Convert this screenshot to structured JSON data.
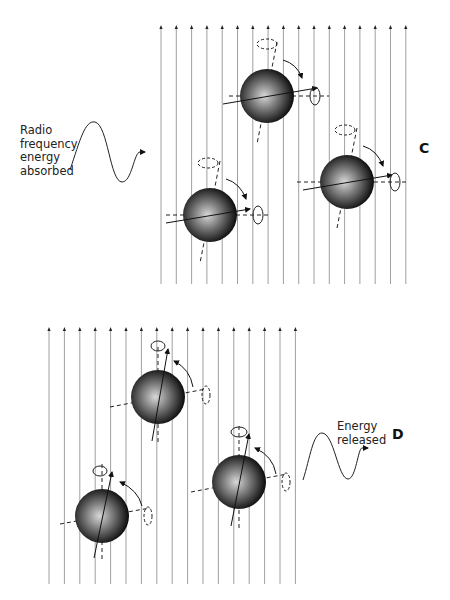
{
  "panel_c": {
    "letter": "C",
    "label_lines": [
      "Radio",
      "frequency",
      "energy",
      "absorbed"
    ],
    "field_lines": {
      "count": 17,
      "x_start": 161,
      "spacing": 15.3,
      "y_top": 25,
      "y_bottom": 284
    },
    "spheres": [
      {
        "cx": 267,
        "cy": 96,
        "r": 27
      },
      {
        "cx": 210,
        "cy": 215,
        "r": 27
      },
      {
        "cx": 347,
        "cy": 182,
        "r": 27
      }
    ]
  },
  "panel_d": {
    "letter": "D",
    "label_lines": [
      "Energy",
      "released"
    ],
    "field_lines": {
      "count": 17,
      "x_start": 49,
      "spacing": 15.4,
      "y_top": 327,
      "y_bottom": 584
    },
    "spheres": [
      {
        "cx": 158,
        "cy": 397,
        "r": 27
      },
      {
        "cx": 102,
        "cy": 516,
        "r": 27
      },
      {
        "cx": 239,
        "cy": 482,
        "r": 27
      }
    ]
  }
}
